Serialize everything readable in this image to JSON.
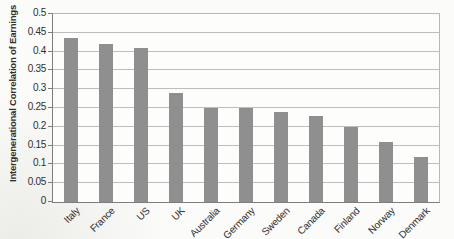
{
  "figure": {
    "background": "#fbfbf9"
  },
  "chart_data": {
    "type": "bar",
    "title": "",
    "ylabel": "Intergenerational Correlation of Earnings",
    "xlabel": "",
    "categories": [
      "Italy",
      "France",
      "US",
      "UK",
      "Australia",
      "Germany",
      "Sweden",
      "Canada",
      "Finland",
      "Norway",
      "Denmark"
    ],
    "values": [
      0.435,
      0.42,
      0.41,
      0.29,
      0.25,
      0.25,
      0.24,
      0.23,
      0.2,
      0.16,
      0.12
    ],
    "ylim": [
      0,
      0.5
    ],
    "yticks": [
      0,
      0.05,
      0.1,
      0.15,
      0.2,
      0.25,
      0.3,
      0.35,
      0.4,
      0.45,
      0.5
    ],
    "ytick_labels": [
      "0",
      "0.05",
      "0.1",
      "0.15",
      "0.2",
      "0.25",
      "0.3",
      "0.35",
      "0.4",
      "0.45",
      "0.5"
    ],
    "grid": true,
    "legend": "none",
    "xlabel_rotation_deg": -45,
    "colors": {
      "bar": "#8f8f8f",
      "gridline": "#bdbdbd",
      "frame": "#b8b8b8",
      "axis": "#7d7d7d",
      "text": "#2f2f2f"
    }
  }
}
